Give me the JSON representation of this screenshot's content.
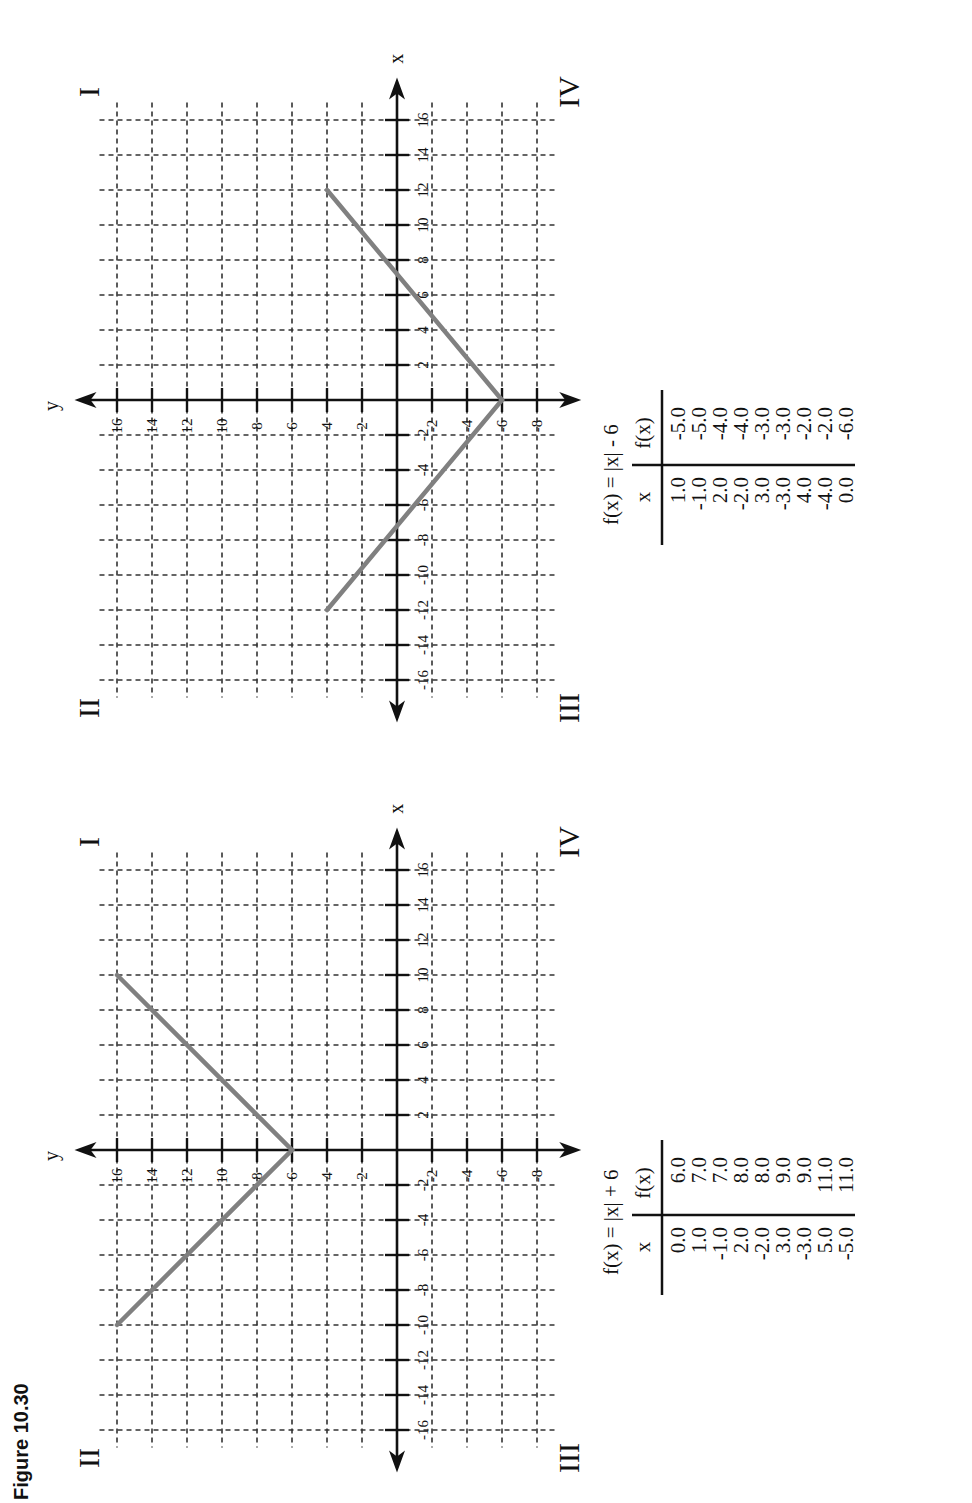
{
  "caption": "Figure 10.30",
  "quadrants": {
    "q1": "I",
    "q2": "II",
    "q3": "III",
    "q4": "IV"
  },
  "axis_names": {
    "x": "x",
    "y": "y"
  },
  "chart_data": [
    {
      "type": "line",
      "title": "f(x) = |x| + 6",
      "xlabel": "x",
      "ylabel": "y",
      "xlim": [
        -17,
        17
      ],
      "ylim": [
        -9,
        17
      ],
      "x_ticks": [
        -16,
        -14,
        -12,
        -10,
        -8,
        -6,
        -4,
        -2,
        2,
        4,
        6,
        8,
        10,
        12,
        14,
        16
      ],
      "y_ticks": [
        -8,
        -6,
        -4,
        -2,
        2,
        4,
        6,
        8,
        10,
        12,
        14,
        16
      ],
      "grid": true,
      "series": [
        {
          "name": "f(x) = |x| + 6",
          "x": [
            -10,
            0,
            12
          ],
          "y": [
            16,
            6,
            18
          ],
          "segment_points": [
            [
              -10,
              16
            ],
            [
              0,
              6
            ],
            [
              10,
              16
            ]
          ]
        }
      ],
      "table": {
        "headers": [
          "x",
          "f(x)"
        ],
        "rows": [
          [
            "0.0",
            "6.0"
          ],
          [
            "1.0",
            "7.0"
          ],
          [
            "-1.0",
            "7.0"
          ],
          [
            "2.0",
            "8.0"
          ],
          [
            "-2.0",
            "8.0"
          ],
          [
            "3.0",
            "9.0"
          ],
          [
            "-3.0",
            "9.0"
          ],
          [
            "5.0",
            "11.0"
          ],
          [
            "-5.0",
            "11.0"
          ]
        ]
      }
    },
    {
      "type": "line",
      "title": "f(x) = |x| - 6",
      "xlabel": "x",
      "ylabel": "y",
      "xlim": [
        -17,
        17
      ],
      "ylim": [
        -9,
        17
      ],
      "x_ticks": [
        -16,
        -14,
        -12,
        -10,
        -8,
        -6,
        -4,
        -2,
        2,
        4,
        6,
        8,
        10,
        12,
        14,
        16
      ],
      "y_ticks": [
        -8,
        -6,
        -4,
        -2,
        2,
        4,
        6,
        8,
        10,
        12,
        14,
        16
      ],
      "grid": true,
      "series": [
        {
          "name": "f(x) = |x| - 6",
          "segment_points": [
            [
              -12,
              4
            ],
            [
              0,
              -6
            ],
            [
              12,
              4
            ]
          ]
        }
      ],
      "table": {
        "headers": [
          "x",
          "f(x)"
        ],
        "rows": [
          [
            "1.0",
            "-5.0"
          ],
          [
            "-1.0",
            "-5.0"
          ],
          [
            "2.0",
            "-4.0"
          ],
          [
            "-2.0",
            "-4.0"
          ],
          [
            "3.0",
            "-3.0"
          ],
          [
            "-3.0",
            "-3.0"
          ],
          [
            "4.0",
            "-2.0"
          ],
          [
            "-4.0",
            "-2.0"
          ],
          [
            "0.0",
            "-6.0"
          ]
        ]
      }
    }
  ]
}
